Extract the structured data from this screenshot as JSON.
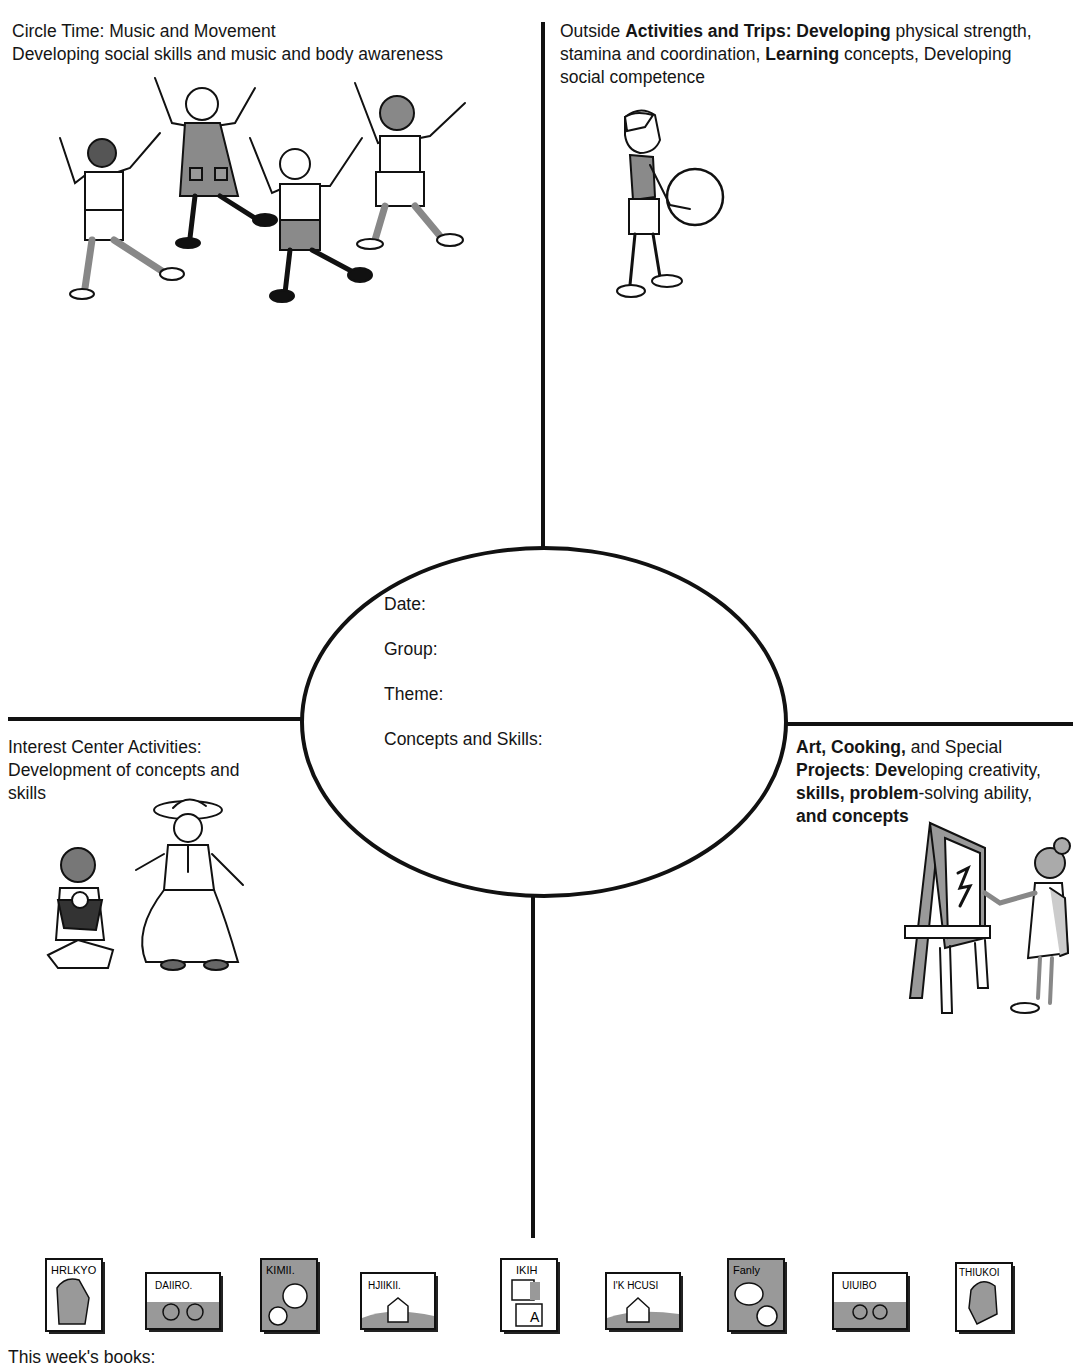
{
  "quadrants": {
    "top_left": {
      "title": "Circle Time: Music and Movement",
      "subtitle": "Developing social skills and music and body awareness",
      "illustration": "children-dancing-illustration"
    },
    "top_right": {
      "parts": [
        {
          "text": "Outside ",
          "bold": false
        },
        {
          "text": "Activities and Trips: Developing",
          "bold": true
        },
        {
          "text": " physical strength, stamina and coordination, ",
          "bold": false
        },
        {
          "text": "Learning",
          "bold": true
        },
        {
          "text": " concepts, Developing social competence",
          "bold": false
        }
      ],
      "line1_a": "Outside ",
      "line1_b": "Activities and Trips: Developing",
      "line1_c": " physical strength,",
      "line2_a": "stamina and coordination, ",
      "line2_b": "Learning",
      "line2_c": " concepts, Developing",
      "line3": "social competence",
      "illustration": "boy-with-ball-illustration"
    },
    "bottom_left": {
      "line1": "Interest Center Activities:",
      "line2": "Development of concepts and",
      "line3": "skills",
      "illustration": "children-dress-up-illustration"
    },
    "bottom_right": {
      "line1_a": "Art, Cooking,",
      "line1_b": " and Special",
      "line2_a": "Projects",
      "line2_b": ": ",
      "line2_c": "Dev",
      "line2_d": "eloping creativity,",
      "line3_a": "skills, problem",
      "line3_b": "-solving ability,",
      "line4": "and concepts",
      "illustration": "girl-painting-easel-illustration"
    }
  },
  "center": {
    "fields": [
      {
        "label": "Date:",
        "value": ""
      },
      {
        "label": "Group:",
        "value": ""
      },
      {
        "label": "Theme:",
        "value": ""
      },
      {
        "label": "Concepts and Skills:",
        "value": ""
      }
    ]
  },
  "books": {
    "label": "This week's books:",
    "items": [
      {
        "cover_text": "HRLKYO",
        "shade": "light",
        "icon": "animal"
      },
      {
        "cover_text": "DAIIRO",
        "shade": "light",
        "icon": "bicycle"
      },
      {
        "cover_text": "KIMII.",
        "shade": "dark",
        "icon": "faces"
      },
      {
        "cover_text": "HJIIKII.",
        "shade": "light",
        "icon": "house"
      },
      {
        "cover_text": "IKIH",
        "shade": "light",
        "icon": "blocks"
      },
      {
        "cover_text": "I'K HCUSI",
        "shade": "light",
        "icon": "house"
      },
      {
        "cover_text": "Fanly",
        "shade": "dark",
        "icon": "faces"
      },
      {
        "cover_text": "UIUIBO",
        "shade": "light",
        "icon": "bicycle"
      },
      {
        "cover_text": "THIUKOI",
        "shade": "light",
        "icon": "animal"
      }
    ]
  },
  "colors": {
    "ink": "#111111",
    "shade": "#9a9a9a",
    "paper": "#ffffff"
  }
}
